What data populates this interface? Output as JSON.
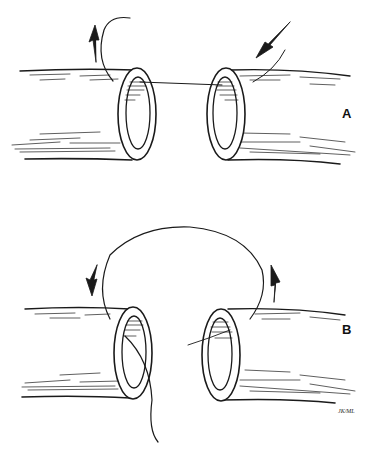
{
  "figure": {
    "panels": [
      {
        "label": "A",
        "description": "Two cut vessel ends with a suture passing between their lumens; arrows indicate needle direction"
      },
      {
        "label": "B",
        "description": "Suture looped over the top from one vessel end to the other; arrows indicate rotation"
      }
    ],
    "signature": "JK/ML",
    "colors": {
      "ink": "#1a1a1a",
      "background": "#ffffff"
    }
  }
}
